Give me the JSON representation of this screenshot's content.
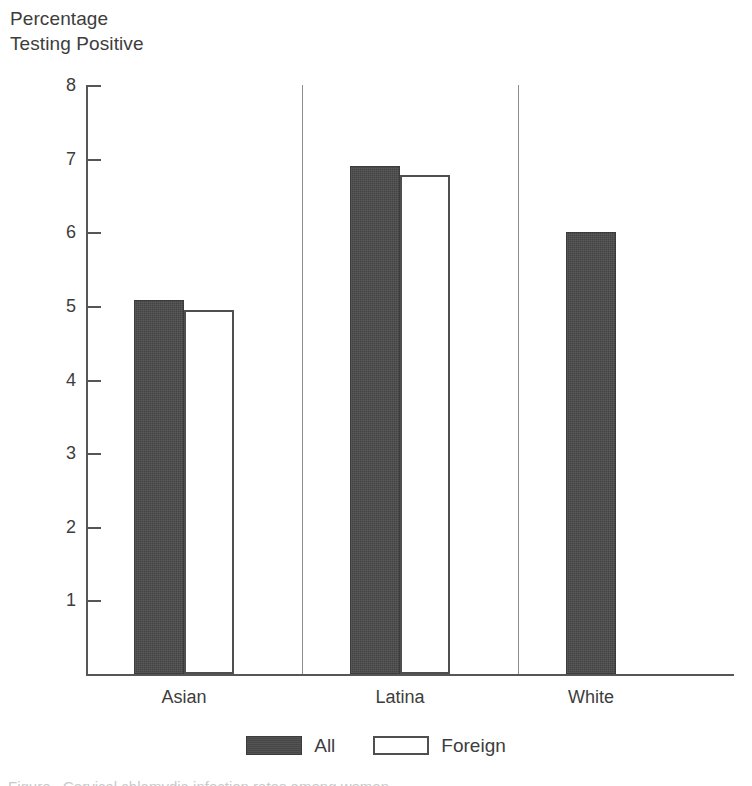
{
  "chart_data": {
    "type": "bar",
    "title": "",
    "ylabel": "Percentage\nTesting Positive",
    "xlabel": "",
    "categories": [
      "Asian",
      "Latina",
      "White"
    ],
    "series": [
      {
        "name": "All",
        "color": "#4a4a4a",
        "values": [
          5.08,
          6.9,
          6.0
        ]
      },
      {
        "name": "Foreign",
        "color": "#ffffff",
        "values": [
          4.95,
          6.78,
          null
        ]
      }
    ],
    "ylim": [
      0,
      8
    ],
    "yticks": [
      8,
      7,
      6,
      5,
      4,
      3,
      2,
      1
    ],
    "ytick_labels": [
      "8",
      "7",
      "6",
      "5",
      "4",
      "3",
      "2",
      "1"
    ],
    "grid": false,
    "legend_position": "bottom"
  },
  "axis": {
    "y_title_line1": "Percentage",
    "y_title_line2": "Testing Positive"
  },
  "legend": {
    "entries": [
      {
        "label": "All",
        "swatch": "filled-dark-swatch"
      },
      {
        "label": "Foreign",
        "swatch": "outlined-white-swatch"
      }
    ]
  },
  "caption": {
    "partial_text": "Figure . Cervical chlamydia infection rates among women"
  }
}
